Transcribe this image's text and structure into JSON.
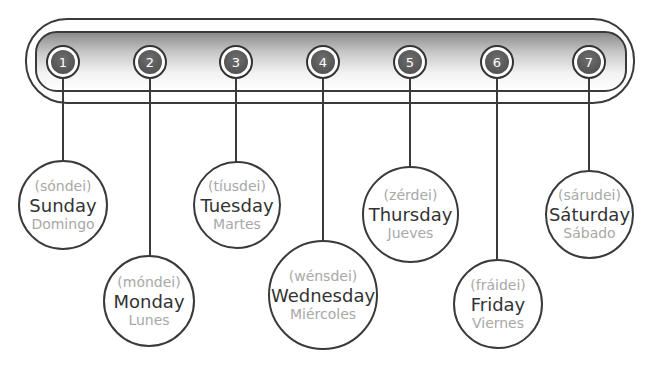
{
  "diagram": {
    "type": "days-of-the-week",
    "numbers": [
      "1",
      "2",
      "3",
      "4",
      "5",
      "6",
      "7"
    ],
    "days": [
      {
        "number": "1",
        "pronunciation": "(sóndei)",
        "english": "Sunday",
        "spanish": "Domingo"
      },
      {
        "number": "2",
        "pronunciation": "(móndei)",
        "english": "Monday",
        "spanish": "Lunes"
      },
      {
        "number": "3",
        "pronunciation": "(tíusdei)",
        "english": "Tuesday",
        "spanish": "Martes"
      },
      {
        "number": "4",
        "pronunciation": "(wénsdei)",
        "english": "Wednesday",
        "spanish": "Miércoles"
      },
      {
        "number": "5",
        "pronunciation": "(zérdei)",
        "english": "Thursday",
        "spanish": "Jueves"
      },
      {
        "number": "6",
        "pronunciation": "(fráidei)",
        "english": "Friday",
        "spanish": "Viernes"
      },
      {
        "number": "7",
        "pronunciation": "(sárudei)",
        "english": "Sáturday",
        "spanish": "Sábado"
      }
    ],
    "colors": {
      "outline": "#3a3a3a",
      "number_fill": "#555555",
      "english_text": "#333333",
      "secondary_text": "#a8a8a8"
    }
  }
}
